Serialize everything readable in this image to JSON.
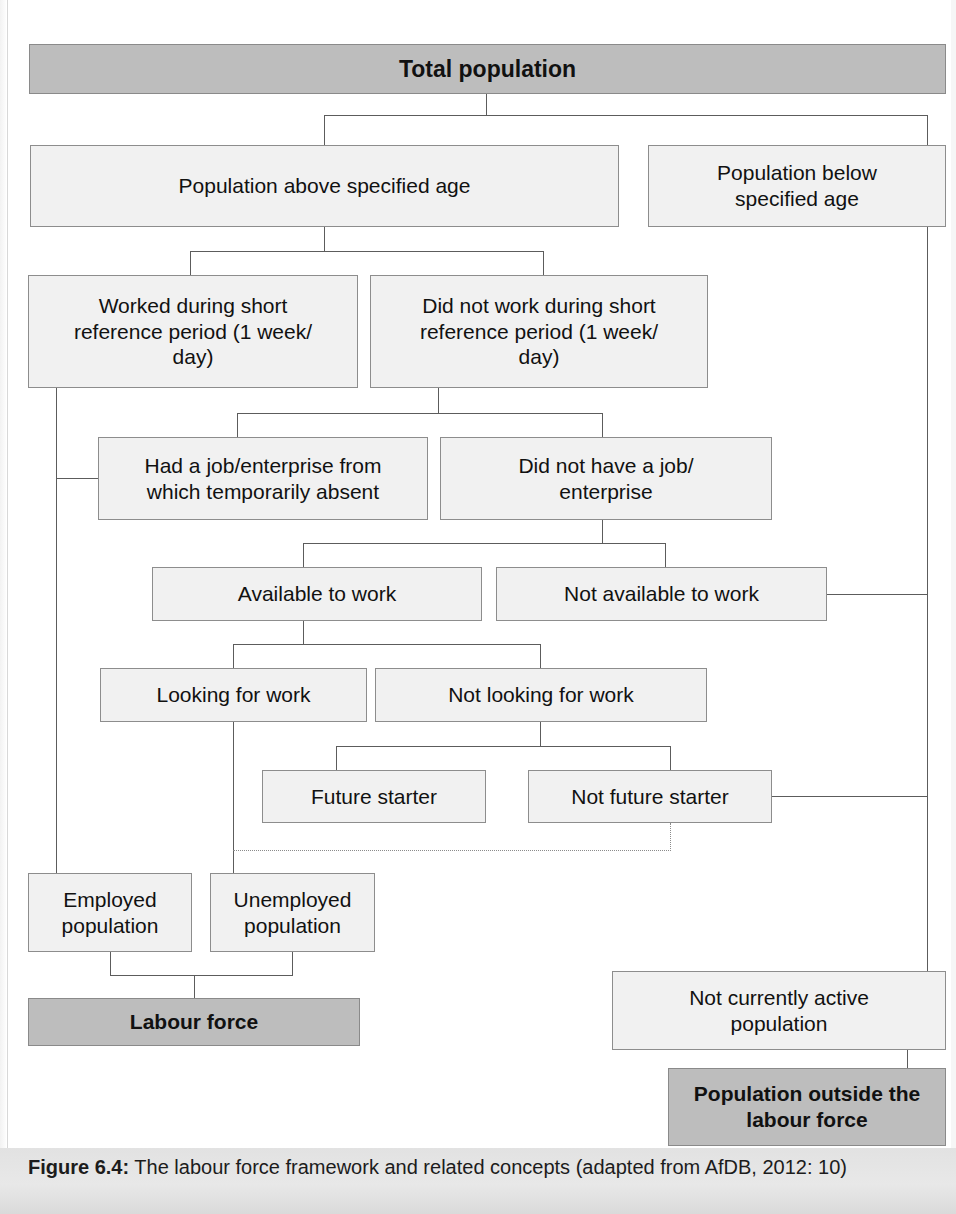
{
  "figure": {
    "caption_label": "Figure 6.4:",
    "caption_text": " The labour force framework and related concepts (adapted from AfDB, 2012: 10)"
  },
  "colors": {
    "shaded_fill": "#bdbdbd",
    "light_fill": "#f0f0f0",
    "border": "#8d8d8d",
    "connector": "#5c5c5c",
    "caption_band": "#e2e2e2"
  },
  "diagram": {
    "type": "flowchart",
    "title": "The labour force framework and related concepts",
    "nodes": [
      {
        "id": "total_population",
        "label": "Total population",
        "style": "shaded"
      },
      {
        "id": "above_age",
        "label": "Population above specified age",
        "style": "light"
      },
      {
        "id": "below_age",
        "label": "Population below\nspecified age",
        "style": "light"
      },
      {
        "id": "worked",
        "label": "Worked during short\nreference period (1 week/\nday)",
        "style": "light"
      },
      {
        "id": "did_not_work",
        "label": "Did not work during short\nreference period (1 week/\nday)",
        "style": "light"
      },
      {
        "id": "had_job",
        "label": "Had a job/enterprise from\nwhich temporarily absent",
        "style": "light"
      },
      {
        "id": "no_job",
        "label": "Did not have a job/\nenterprise",
        "style": "light"
      },
      {
        "id": "available",
        "label": "Available to work",
        "style": "light"
      },
      {
        "id": "not_available",
        "label": "Not available to work",
        "style": "light"
      },
      {
        "id": "looking",
        "label": "Looking for work",
        "style": "light"
      },
      {
        "id": "not_looking",
        "label": "Not looking for work",
        "style": "light"
      },
      {
        "id": "future_starter",
        "label": "Future starter",
        "style": "light"
      },
      {
        "id": "not_future_starter",
        "label": "Not future starter",
        "style": "light"
      },
      {
        "id": "employed",
        "label": "Employed\npopulation",
        "style": "light"
      },
      {
        "id": "unemployed",
        "label": "Unemployed\npopulation",
        "style": "light"
      },
      {
        "id": "labour_force",
        "label": "Labour force",
        "style": "shaded"
      },
      {
        "id": "not_currently_active",
        "label": "Not currently active\npopulation",
        "style": "light"
      },
      {
        "id": "outside_labour_force",
        "label": "Population outside the\nlabour force",
        "style": "shaded"
      }
    ],
    "edges": [
      {
        "from": "total_population",
        "to": "above_age",
        "style": "solid"
      },
      {
        "from": "total_population",
        "to": "below_age",
        "style": "solid"
      },
      {
        "from": "above_age",
        "to": "worked",
        "style": "solid"
      },
      {
        "from": "above_age",
        "to": "did_not_work",
        "style": "solid"
      },
      {
        "from": "did_not_work",
        "to": "had_job",
        "style": "solid"
      },
      {
        "from": "did_not_work",
        "to": "no_job",
        "style": "solid"
      },
      {
        "from": "worked",
        "to": "employed",
        "style": "solid"
      },
      {
        "from": "had_job",
        "to": "employed",
        "style": "solid"
      },
      {
        "from": "no_job",
        "to": "available",
        "style": "solid"
      },
      {
        "from": "no_job",
        "to": "not_available",
        "style": "solid"
      },
      {
        "from": "available",
        "to": "looking",
        "style": "solid"
      },
      {
        "from": "available",
        "to": "not_looking",
        "style": "solid"
      },
      {
        "from": "not_looking",
        "to": "future_starter",
        "style": "solid"
      },
      {
        "from": "not_looking",
        "to": "not_future_starter",
        "style": "solid"
      },
      {
        "from": "looking",
        "to": "unemployed",
        "style": "solid"
      },
      {
        "from": "not_future_starter",
        "to": "unemployed",
        "style": "dotted"
      },
      {
        "from": "employed",
        "to": "labour_force",
        "style": "solid"
      },
      {
        "from": "unemployed",
        "to": "labour_force",
        "style": "solid"
      },
      {
        "from": "not_available",
        "to": "not_currently_active",
        "style": "solid"
      },
      {
        "from": "not_future_starter",
        "to": "not_currently_active",
        "style": "solid"
      },
      {
        "from": "below_age",
        "to": "outside_labour_force",
        "style": "solid"
      },
      {
        "from": "not_currently_active",
        "to": "outside_labour_force",
        "style": "solid"
      }
    ]
  }
}
